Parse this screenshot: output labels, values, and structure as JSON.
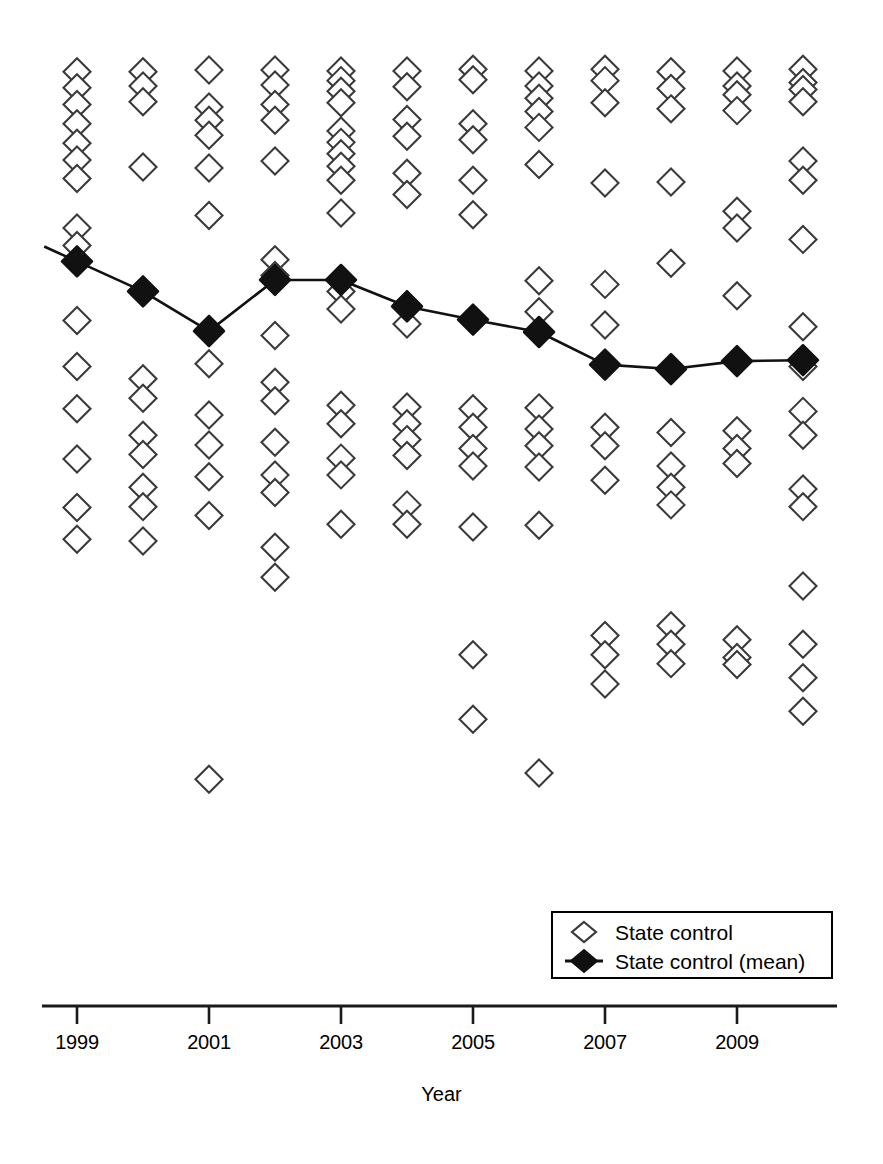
{
  "chart_data": {
    "type": "scatter",
    "title": "",
    "subtitle": "",
    "xlabel": "Year",
    "ylabel": "",
    "grid": false,
    "legend_position": "bottom-right",
    "xlim": [
      1998.5,
      2010.6
    ],
    "ylim": [
      0,
      100
    ],
    "xticks": [
      1999,
      2001,
      2003,
      2005,
      2007,
      2009
    ],
    "xtick_labels": [
      "1999",
      "2001",
      "2003",
      "2005",
      "2007",
      "2009"
    ],
    "x": [
      1999,
      2000,
      2001,
      2002,
      2003,
      2004,
      2005,
      2006,
      2007,
      2008,
      2009,
      2010
    ],
    "series": [
      {
        "name": "State control",
        "type": "scatter",
        "marker": "open-diamond",
        "color": "#000000",
        "fill": "#ffffff",
        "points": [
          {
            "x": 1999,
            "values": [
              97.3,
              95.5,
              93.6,
              91.4,
              89.2,
              87.3,
              85.2,
              79.6,
              77.6,
              69.1,
              63.9,
              59.1,
              53.4,
              47.9,
              44.3
            ]
          },
          {
            "x": 2000,
            "values": [
              97.3,
              95.7,
              93.9,
              86.5,
              62.5,
              60.3,
              56.1,
              53.9,
              50.2,
              48.0,
              44.1
            ]
          },
          {
            "x": 2001,
            "values": [
              97.5,
              93.3,
              91.8,
              90.1,
              86.4,
              81.0,
              68.1,
              64.2,
              58.4,
              55.0,
              51.4,
              47.0,
              17.1
            ]
          },
          {
            "x": 2002,
            "values": [
              97.5,
              95.8,
              93.6,
              91.8,
              87.2,
              76.0,
              74.2,
              67.4,
              62.1,
              60.0,
              55.3,
              51.6,
              49.6,
              43.4,
              40.0
            ]
          },
          {
            "x": 2003,
            "values": [
              97.4,
              96.3,
              95.1,
              93.8,
              90.6,
              89.3,
              88.0,
              86.6,
              85.0,
              81.3,
              72.4,
              70.4,
              59.5,
              57.4,
              53.5,
              51.6,
              46.0
            ]
          },
          {
            "x": 2004,
            "values": [
              97.4,
              95.6,
              91.9,
              90.0,
              85.8,
              83.4,
              70.9,
              68.7,
              59.3,
              57.4,
              55.6,
              53.8,
              48.2,
              46.0
            ]
          },
          {
            "x": 2005,
            "values": [
              97.6,
              96.4,
              91.4,
              89.6,
              85.0,
              81.1,
              59.1,
              57.0,
              54.6,
              52.6,
              45.7,
              31.2,
              23.9
            ]
          },
          {
            "x": 2006,
            "values": [
              97.4,
              95.7,
              94.3,
              92.8,
              91.0,
              86.8,
              73.6,
              70.1,
              59.2,
              56.8,
              54.9,
              52.5,
              45.9,
              17.8
            ]
          },
          {
            "x": 2007,
            "values": [
              97.6,
              96.3,
              93.8,
              84.7,
              73.2,
              68.6,
              57.0,
              54.9,
              51.0,
              33.4,
              31.2,
              27.9
            ]
          },
          {
            "x": 2008,
            "values": [
              97.3,
              95.4,
              93.1,
              84.8,
              75.6,
              56.4,
              52.6,
              50.2,
              48.2,
              34.5,
              32.4,
              30.2
            ]
          },
          {
            "x": 2009,
            "values": [
              97.4,
              95.7,
              94.7,
              92.9,
              81.5,
              79.6,
              71.9,
              56.6,
              54.6,
              52.9,
              32.9,
              30.9,
              30.1
            ]
          },
          {
            "x": 2010,
            "values": [
              97.6,
              96.1,
              95.3,
              93.9,
              87.2,
              85.0,
              78.3,
              68.4,
              63.9,
              58.8,
              56.1,
              50.0,
              48.0,
              39.0,
              32.4,
              28.6,
              24.8
            ]
          }
        ]
      },
      {
        "name": "State control (mean)",
        "type": "line",
        "marker": "filled-diamond",
        "color": "#000000",
        "values": [
          75.8,
          72.4,
          67.9,
          73.7,
          73.7,
          70.7,
          69.2,
          67.8,
          64.1,
          63.6,
          64.5,
          64.6
        ]
      }
    ],
    "legend": [
      {
        "label": "State control",
        "marker": "open-diamond",
        "line": false
      },
      {
        "label": "State control (mean)",
        "marker": "filled-diamond",
        "line": true
      }
    ]
  },
  "axis": {
    "x_title": "Year",
    "tick_labels": [
      {
        "label": "1999",
        "x_px": 77
      },
      {
        "label": "2001",
        "x_px": 209
      },
      {
        "label": "2003",
        "x_px": 341
      },
      {
        "label": "2005",
        "x_px": 473
      },
      {
        "label": "2007",
        "x_px": 605
      },
      {
        "label": "2009",
        "x_px": 737
      }
    ]
  },
  "legend": {
    "items": [
      {
        "label": "State control",
        "icon": "open-diamond-marker"
      },
      {
        "label": "State control (mean)",
        "icon": "filled-diamond-line-marker"
      }
    ]
  },
  "colors": {
    "foreground": "#1a1a1a",
    "background": "#ffffff",
    "marker_stroke": "#3a3a3a",
    "mean_fill": "#111111"
  }
}
